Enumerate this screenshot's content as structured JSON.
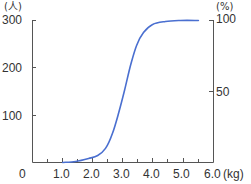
{
  "chart_data": {
    "type": "line",
    "title": "",
    "xlabel": "(kg)",
    "ylabel_left": "(人)",
    "ylabel_right": "(%)",
    "xlim": [
      0,
      6.0
    ],
    "ylim_left": [
      0,
      300
    ],
    "ylim_right": [
      0,
      100
    ],
    "grid": false,
    "legend": null,
    "x_ticks": [
      "0",
      "1.0",
      "2.0",
      "3.0",
      "4.0",
      "5.0",
      "6.0"
    ],
    "y_left_ticks": [
      "0",
      "100",
      "200",
      "300"
    ],
    "y_right_ticks": [
      "50",
      "100"
    ],
    "series": [
      {
        "name": "cumulative percentage",
        "axis": "right",
        "color": "#4a6fd0",
        "x": [
          1.0,
          1.43,
          1.86,
          2.16,
          2.42,
          2.65,
          2.85,
          3.05,
          3.25,
          3.45,
          3.68,
          3.98,
          4.41,
          4.91,
          5.5
        ],
        "y": [
          0,
          0.7,
          2.8,
          4.9,
          9.9,
          20.4,
          34.5,
          50.7,
          68.3,
          82.4,
          91.5,
          97.2,
          99.3,
          100,
          100
        ]
      }
    ]
  },
  "labels": {
    "y_left_unit": "(人)",
    "y_right_unit": "(%)",
    "x_unit": "(kg)",
    "y_left": [
      "0",
      "100",
      "200",
      "300"
    ],
    "y_right": [
      "50",
      "100"
    ],
    "x": [
      "1.0",
      "2.0",
      "3.0",
      "4.0",
      "5.0",
      "6.0"
    ]
  },
  "colors": {
    "curve": "#4a6fd0",
    "axis": "#555555",
    "text": "#333333"
  }
}
